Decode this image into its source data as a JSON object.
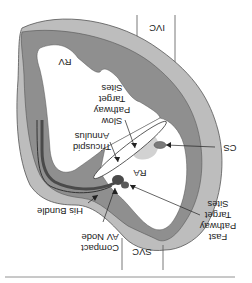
{
  "figure": {
    "orientation": "rotated-180",
    "colors": {
      "outer_wall": "#bdbdbd",
      "inner_wall": "#8f8f8f",
      "chamber": "#ffffff",
      "node": "#4a4a4a",
      "slow_zone": "#d2d2d2",
      "ink": "#222222"
    },
    "labels": {
      "ivc": "IVC",
      "rv": "RV",
      "slow_pathway": [
        "Slow",
        "Pathway",
        "Target",
        "Sites"
      ],
      "tricuspid_annulus": [
        "Tricuspid",
        "Annulus"
      ],
      "cs": "CS",
      "ra": "RA",
      "his_bundle": "His Bundle",
      "fast_pathway": [
        "Fast",
        "Pathway",
        "Target",
        "Sites"
      ],
      "compact_av_node": [
        "Compact",
        "AV Node"
      ],
      "svc": "SVC"
    }
  }
}
